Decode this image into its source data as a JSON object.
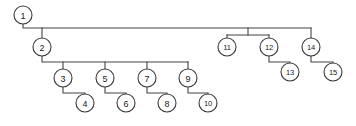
{
  "diagram": {
    "type": "tree",
    "style": {
      "background_color": "#ffffff",
      "line_color": "#444444",
      "node_fill_color": "#ffffff",
      "node_stroke_color": "#3a3a3a",
      "label_color": "#1a1a1a",
      "node_radius": 9
    },
    "nodes": [
      {
        "id": "1",
        "label": "1",
        "cx": 23,
        "cy": 15
      },
      {
        "id": "2",
        "label": "2",
        "cx": 42,
        "cy": 47
      },
      {
        "id": "3",
        "label": "3",
        "cx": 63,
        "cy": 78
      },
      {
        "id": "4",
        "label": "4",
        "cx": 85,
        "cy": 103
      },
      {
        "id": "5",
        "label": "5",
        "cx": 105,
        "cy": 78
      },
      {
        "id": "6",
        "label": "6",
        "cx": 126,
        "cy": 103
      },
      {
        "id": "7",
        "label": "7",
        "cx": 147,
        "cy": 78
      },
      {
        "id": "8",
        "label": "8",
        "cx": 167,
        "cy": 103
      },
      {
        "id": "9",
        "label": "9",
        "cx": 188,
        "cy": 78
      },
      {
        "id": "10",
        "label": "10",
        "cx": 208,
        "cy": 103
      },
      {
        "id": "11",
        "label": "11",
        "cx": 227,
        "cy": 47
      },
      {
        "id": "12",
        "label": "12",
        "cx": 269,
        "cy": 47
      },
      {
        "id": "13",
        "label": "13",
        "cx": 290,
        "cy": 72
      },
      {
        "id": "14",
        "label": "14",
        "cx": 311,
        "cy": 47
      },
      {
        "id": "15",
        "label": "15",
        "cx": 333,
        "cy": 72
      }
    ],
    "edges": [
      {
        "from": "1",
        "to": "2",
        "name": "edge-1-2"
      },
      {
        "from": "1",
        "to": "11",
        "name": "edge-1-11"
      },
      {
        "from": "1",
        "to": "12",
        "name": "edge-1-12"
      },
      {
        "from": "1",
        "to": "14",
        "name": "edge-1-14"
      },
      {
        "from": "2",
        "to": "3",
        "name": "edge-2-3"
      },
      {
        "from": "2",
        "to": "5",
        "name": "edge-2-5"
      },
      {
        "from": "2",
        "to": "7",
        "name": "edge-2-7"
      },
      {
        "from": "2",
        "to": "9",
        "name": "edge-2-9"
      },
      {
        "from": "3",
        "to": "4",
        "name": "edge-3-4"
      },
      {
        "from": "5",
        "to": "6",
        "name": "edge-5-6"
      },
      {
        "from": "7",
        "to": "8",
        "name": "edge-7-8"
      },
      {
        "from": "9",
        "to": "10",
        "name": "edge-9-10"
      },
      {
        "from": "12",
        "to": "13",
        "name": "edge-12-13"
      },
      {
        "from": "14",
        "to": "15",
        "name": "edge-14-15"
      }
    ],
    "paths": {
      "root_bus": "M 23 24 L 23 28 L 311 28",
      "node2_drop": "M 42 28 L 42 38",
      "node2_bus": "M 42 56 L 42 62 L 188 62",
      "node3_drop": "M 63 62 L 63 69",
      "node5_drop": "M 105 62 L 105 69",
      "node7_drop": "M 147 62 L 147 69",
      "node9_drop": "M 188 62 L 188 69",
      "sub1112_drop": "M 248 28 L 248 35",
      "sub1112_bus": "M 227 35 L 269 35",
      "node11_drop": "M 227 35 L 227 38",
      "node12_drop": "M 269 35 L 269 38",
      "node14_drop": "M 311 28 L 311 38",
      "leaf_3_4": "M 63 87 L 63 93 L 85 93 L 85 94",
      "leaf_5_6": "M 105 87 L 105 93 L 126 93 L 126 94",
      "leaf_7_8": "M 147 87 L 147 93 L 167 93 L 167 94",
      "leaf_9_10": "M 188 87 L 188 93 L 208 93 L 208 94",
      "leaf_12_13": "M 269 56 L 269 62 L 290 62 L 290 63",
      "leaf_14_15": "M 311 56 L 311 62 L 333 62 L 333 63"
    }
  }
}
